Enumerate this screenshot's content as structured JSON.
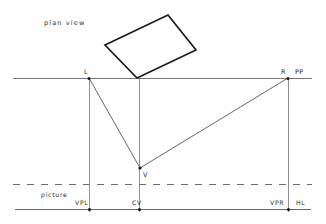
{
  "diagram": {
    "title": "plan view",
    "picture_label": "picture",
    "colors": {
      "line": "#555555",
      "construction": "#5a5a5a",
      "object": "#1a1a1a",
      "dash": "#6b6b6b",
      "text": "#2b2b2b",
      "background": "#ffffff"
    },
    "labels": {
      "plan_view": "plan view",
      "station_left": "L",
      "station_right": "R",
      "picture_plane": "PP",
      "viewpoint": "V",
      "vanish_left": "VPL",
      "center_vision": "CV",
      "vanish_right": "VPR",
      "horizon_line": "HL",
      "picture": "picture"
    },
    "lines": {
      "picture_plane": {
        "name": "PP",
        "y": 78,
        "x1": 13,
        "x2": 312,
        "style": "solid"
      },
      "picture_edge": {
        "name": "picture",
        "y": 184,
        "x1": 13,
        "x2": 312,
        "style": "dashed"
      },
      "horizon": {
        "name": "HL",
        "y": 209,
        "x1": 15,
        "x2": 311,
        "style": "solid"
      },
      "vertical_left": {
        "name": "VPL",
        "x": 89,
        "y1": 78,
        "y2": 211
      },
      "vertical_center": {
        "name": "CV",
        "x": 139,
        "y1": 78,
        "y2": 211
      },
      "vertical_right": {
        "name": "VPR",
        "x": 288,
        "y1": 78,
        "y2": 211
      }
    },
    "points": {
      "L": {
        "x": 89,
        "y": 78
      },
      "R": {
        "x": 288,
        "y": 78
      },
      "V": {
        "x": 140,
        "y": 168
      },
      "VPL": {
        "x": 89,
        "y": 209
      },
      "CV": {
        "x": 139,
        "y": 209
      },
      "VPR": {
        "x": 288,
        "y": 209
      }
    },
    "sight_lines": [
      {
        "name": "L-to-V",
        "x1": 89,
        "y1": 78,
        "x2": 140,
        "y2": 168
      },
      {
        "name": "V-to-R",
        "x1": 140,
        "y1": 168,
        "x2": 288,
        "y2": 78
      }
    ],
    "object_rect": {
      "name": "plan-rectangle",
      "corners": [
        {
          "x": 105,
          "y": 45
        },
        {
          "x": 168,
          "y": 15
        },
        {
          "x": 196,
          "y": 50
        },
        {
          "x": 137,
          "y": 78
        }
      ]
    }
  }
}
